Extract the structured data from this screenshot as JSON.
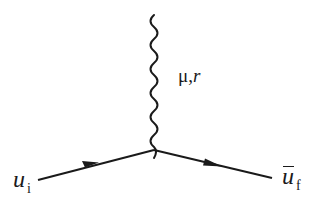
{
  "diagram": {
    "type": "feynman-vertex",
    "colors": {
      "stroke": "#1a1a1a",
      "background": "#ffffff"
    },
    "vertex": {
      "x": 154,
      "y": 150
    },
    "boson": {
      "style": "wavy",
      "label_main": "μ,",
      "label_index": "r",
      "from": {
        "x": 154,
        "y": 15
      },
      "to": {
        "x": 154,
        "y": 150
      }
    },
    "incoming_fermion": {
      "style": "solid-arrow",
      "label_main": "u",
      "label_sub": "i",
      "from": {
        "x": 38,
        "y": 180
      },
      "to": {
        "x": 154,
        "y": 150
      }
    },
    "outgoing_fermion": {
      "style": "solid-arrow",
      "label_main": "u",
      "label_sub": "f",
      "overbar": true,
      "from": {
        "x": 154,
        "y": 150
      },
      "to": {
        "x": 272,
        "y": 178
      }
    }
  }
}
